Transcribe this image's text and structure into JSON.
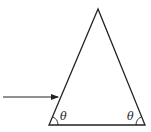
{
  "diagram": {
    "shape": "isosceles-triangle",
    "vertices": {
      "apex": [
        98,
        9
      ],
      "bottom_left": [
        49,
        125
      ],
      "bottom_right": [
        145,
        125
      ]
    },
    "incident_arrow": {
      "from": [
        3,
        97
      ],
      "to": [
        58,
        97
      ]
    },
    "angle_labels": {
      "left": "θ",
      "right": "θ"
    },
    "colors": {
      "stroke": "#222222",
      "background": "#ffffff"
    }
  }
}
